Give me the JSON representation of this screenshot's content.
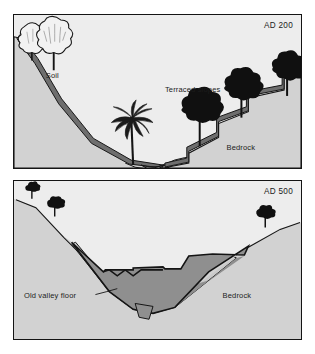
{
  "figure": {
    "title_visible": false,
    "background_color": "#ffffff",
    "panel_count": 2
  },
  "palette": {
    "sky": "#ededed",
    "bedrock": "#d2d2d2",
    "soil_dark": "#6e6e6e",
    "alluvium": "#8f8f8f",
    "old_floor": "#c9c9c9",
    "outline": "#141414",
    "tree_dark": "#101010",
    "tree_light": "#f2f2f2",
    "text": "#1c1c1c"
  },
  "panels": [
    {
      "id": "panel-top",
      "era_label": "AD 200",
      "labels": [
        {
          "name": "soil",
          "text": "Soil"
        },
        {
          "name": "terraced-slopes",
          "text": "Terraced slopes"
        },
        {
          "name": "bedrock",
          "text": "Bedrock"
        }
      ],
      "features": {
        "trees_light_left": 2,
        "palm_valley_floor": 1,
        "trees_dark_terraces": 3,
        "terrace_steps": 4
      }
    },
    {
      "id": "panel-bottom",
      "era_label": "AD 500",
      "labels": [
        {
          "name": "old-valley-floor",
          "text": "Old valley floor"
        },
        {
          "name": "bedrock",
          "text": "Bedrock"
        }
      ],
      "features": {
        "trees_dark_left": 2,
        "trees_dark_right": 1,
        "alluvial_fill": 1,
        "buried_channel": 1
      }
    }
  ]
}
